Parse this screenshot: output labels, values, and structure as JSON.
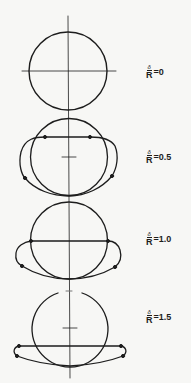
{
  "diagram": {
    "line_color": "#1d1d1d",
    "background": "#f7f7f5",
    "panels": [
      {
        "id": "panel-0",
        "numerator": "δ",
        "denominator": "R",
        "equals": "=",
        "value": "0"
      },
      {
        "id": "panel-0.5",
        "numerator": "δ",
        "denominator": "R",
        "equals": "=",
        "value": "0.5"
      },
      {
        "id": "panel-1.0",
        "numerator": "δ",
        "denominator": "R",
        "equals": "=",
        "value": "1.0"
      },
      {
        "id": "panel-1.5",
        "numerator": "δ",
        "denominator": "R",
        "equals": "=",
        "value": "1.5"
      }
    ]
  }
}
